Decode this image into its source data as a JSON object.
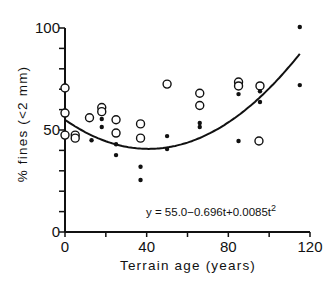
{
  "chart_data": {
    "type": "scatter",
    "title": "",
    "xlabel": "Terrain age (years)",
    "ylabel": "% fines (<2 mm)",
    "xlim": [
      0,
      120
    ],
    "ylim": [
      0,
      100
    ],
    "x_ticks": [
      0,
      40,
      80,
      120
    ],
    "y_ticks": [
      0,
      50,
      100
    ],
    "x_minor_step": 20,
    "y_minor_step": 10,
    "grid": false,
    "legend": null,
    "series": [
      {
        "name": "open circles",
        "marker": "open-circle",
        "points": [
          [
            0,
            70.6
          ],
          [
            0,
            58.3
          ],
          [
            0,
            47.5
          ],
          [
            5,
            47.5
          ],
          [
            5,
            46
          ],
          [
            12,
            56
          ],
          [
            18,
            61
          ],
          [
            18,
            59
          ],
          [
            25,
            55
          ],
          [
            25,
            48.5
          ],
          [
            37,
            53
          ],
          [
            37,
            46
          ],
          [
            50,
            72.5
          ],
          [
            66,
            68
          ],
          [
            66,
            62
          ],
          [
            85,
            73.5
          ],
          [
            85,
            71.6
          ],
          [
            95.5,
            71.6
          ],
          [
            95,
            44.6
          ]
        ]
      },
      {
        "name": "filled dots",
        "marker": "filled-dot",
        "points": [
          [
            13,
            45
          ],
          [
            18,
            55.4
          ],
          [
            18,
            51.5
          ],
          [
            25,
            43
          ],
          [
            25,
            37.7
          ],
          [
            37,
            32
          ],
          [
            37,
            25.5
          ],
          [
            50,
            47
          ],
          [
            50,
            40.7
          ],
          [
            66,
            53.4
          ],
          [
            66,
            51.5
          ],
          [
            85,
            67.6
          ],
          [
            85,
            44.6
          ],
          [
            95.5,
            69
          ],
          [
            95.5,
            63.7
          ],
          [
            115,
            100.5
          ],
          [
            115,
            72
          ]
        ]
      }
    ],
    "fit": {
      "type": "quadratic",
      "coefficients": {
        "a": 55.0,
        "b": -0.696,
        "c": 0.0085
      },
      "t_range": [
        0,
        115
      ],
      "equation_label": "y = 55.0−0.696t+0.0085t",
      "equation_superscript": "2"
    }
  }
}
